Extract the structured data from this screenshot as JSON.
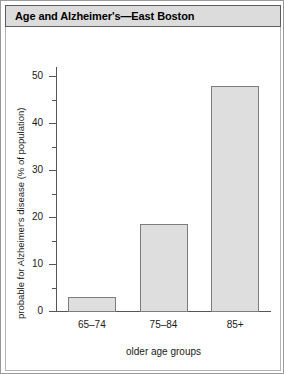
{
  "figure": {
    "title": "Age and Alzheimer's—East Boston"
  },
  "colors": {
    "bar_fill": "#dedede",
    "bar_stroke": "#7d7d7d",
    "axis": "#555555",
    "title_bar_bg": "#dcdcdc",
    "frame": "#9a9a9a",
    "text": "#1a1a1a"
  },
  "chart_data": {
    "type": "bar",
    "title": "Age and Alzheimer's—East Boston",
    "xlabel": "older age groups",
    "ylabel": "probable for Alzheimer's disease (% of population)",
    "categories": [
      "65–74",
      "75–84",
      "85+"
    ],
    "values": [
      3.2,
      18.7,
      48.1
    ],
    "ylim": [
      0,
      52
    ],
    "yticks": [
      0,
      10,
      20,
      30,
      40,
      50
    ],
    "ytick_labels": [
      "0",
      "10",
      "20",
      "30",
      "40",
      "50"
    ],
    "yminor_ticks": [
      5,
      15,
      25,
      35,
      45
    ],
    "grid": false,
    "legend": null
  }
}
